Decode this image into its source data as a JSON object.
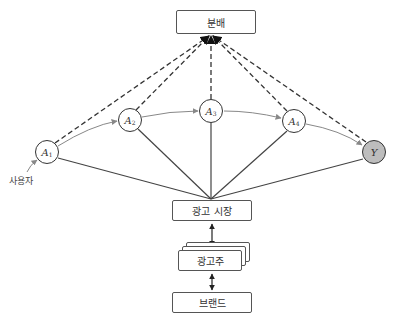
{
  "boxes": {
    "distribution": "분배",
    "ad_market": "광고 시장",
    "advertiser": "광고주",
    "brand": "브랜드"
  },
  "nodes": [
    {
      "id": "A1",
      "letter": "A",
      "sub": "1"
    },
    {
      "id": "A2",
      "letter": "A",
      "sub": "2"
    },
    {
      "id": "A3",
      "letter": "A",
      "sub": "3"
    },
    {
      "id": "A4",
      "letter": "A",
      "sub": "4"
    },
    {
      "id": "Y",
      "letter": "Y",
      "sub": ""
    }
  ],
  "user_label": "사용자",
  "colors": {
    "line": "#444444",
    "y_fill": "#bdbdbd",
    "gray_edge": "#888888"
  }
}
